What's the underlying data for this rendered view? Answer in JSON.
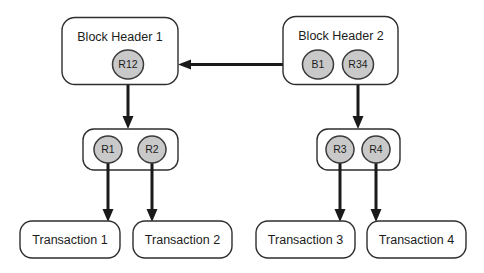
{
  "diagram": {
    "background_color": "#ffffff",
    "line_color": "#1a1a1a",
    "box_stroke_color": "#2e2e2e",
    "circle_fill_color": "#c9c9c9",
    "circle_stroke_color": "#3a3a3a",
    "text_color": "#1c1c1c",
    "headers": [
      {
        "id": "block-header-1",
        "label": "Block Header 1"
      },
      {
        "id": "block-header-2",
        "label": "Block Header 2"
      }
    ],
    "header_nodes": [
      {
        "id": "node-r12",
        "label": "R12",
        "parent": "block-header-1"
      },
      {
        "id": "node-b1",
        "label": "B1",
        "parent": "block-header-2"
      },
      {
        "id": "node-r34",
        "label": "R34",
        "parent": "block-header-2"
      }
    ],
    "hash_nodes": [
      {
        "id": "node-r1",
        "label": "R1"
      },
      {
        "id": "node-r2",
        "label": "R2"
      },
      {
        "id": "node-r3",
        "label": "R3"
      },
      {
        "id": "node-r4",
        "label": "R4"
      }
    ],
    "transactions": [
      {
        "id": "transaction-1",
        "label": "Transaction 1"
      },
      {
        "id": "transaction-2",
        "label": "Transaction 2"
      },
      {
        "id": "transaction-3",
        "label": "Transaction 3"
      },
      {
        "id": "transaction-4",
        "label": "Transaction 4"
      }
    ],
    "edges": [
      {
        "id": "edge-b1-to-header1",
        "from": "node-b1",
        "to": "block-header-1",
        "direction": "left"
      },
      {
        "id": "edge-r12-to-r1r2",
        "from": "node-r12",
        "to": "hash-group-left",
        "direction": "down"
      },
      {
        "id": "edge-r34-to-r3r4",
        "from": "node-r34",
        "to": "hash-group-right",
        "direction": "down"
      },
      {
        "id": "edge-r1-to-transaction-1",
        "from": "node-r1",
        "to": "transaction-1",
        "direction": "down"
      },
      {
        "id": "edge-r2-to-transaction-2",
        "from": "node-r2",
        "to": "transaction-2",
        "direction": "down"
      },
      {
        "id": "edge-r3-to-transaction-3",
        "from": "node-r3",
        "to": "transaction-3",
        "direction": "down"
      },
      {
        "id": "edge-r4-to-transaction-4",
        "from": "node-r4",
        "to": "transaction-4",
        "direction": "down"
      }
    ]
  }
}
